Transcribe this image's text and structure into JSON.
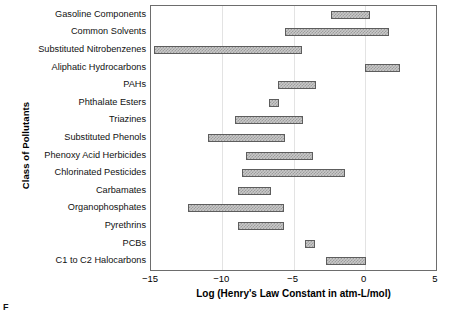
{
  "chart_data": {
    "type": "bar",
    "orientation": "horizontal",
    "subtype": "range-bar",
    "title": "",
    "xlabel": "Log (Henry's Law Constant in atm-L/mol)",
    "ylabel": "Class of Pollutants",
    "xlim": [
      -15,
      5
    ],
    "xticks": [
      -15,
      -10,
      -5,
      0,
      5
    ],
    "xticklabels": [
      "−15",
      "−10",
      "−5",
      "0",
      "5"
    ],
    "grid": "vertical-light",
    "legend": "none",
    "categories": [
      "Gasoline Components",
      "Common Solvents",
      "Substituted Nitrobenzenes",
      "Aliphatic Hydrocarbons",
      "PAHs",
      "Phthalate Esters",
      "Triazines",
      "Substituted Phenols",
      "Phenoxy Acid Herbicides",
      "Chlorinated Pesticides",
      "Carbamates",
      "Organophosphates",
      "Pyrethrins",
      "PCBs",
      "C1 to C2 Halocarbons"
    ],
    "ranges": [
      {
        "category": "Gasoline Components",
        "low": -2.4,
        "high": 0.4
      },
      {
        "category": "Common Solvents",
        "low": -5.6,
        "high": 1.7
      },
      {
        "category": "Substituted Nitrobenzenes",
        "low": -14.8,
        "high": -4.4
      },
      {
        "category": "Aliphatic Hydrocarbons",
        "low": 0.0,
        "high": 2.5
      },
      {
        "category": "PAHs",
        "low": -6.1,
        "high": -3.4
      },
      {
        "category": "Phthalate Esters",
        "low": -6.7,
        "high": -6.0
      },
      {
        "category": "Triazines",
        "low": -9.1,
        "high": -4.3
      },
      {
        "category": "Substituted Phenols",
        "low": -11.0,
        "high": -5.6
      },
      {
        "category": "Phenoxy Acid Herbicides",
        "low": -8.3,
        "high": -3.6
      },
      {
        "category": "Chlorinated Pesticides",
        "low": -8.6,
        "high": -1.4
      },
      {
        "category": "Carbamates",
        "low": -8.9,
        "high": -6.6
      },
      {
        "category": "Organophosphates",
        "low": -12.4,
        "high": -5.7
      },
      {
        "category": "Pyrethrins",
        "low": -8.9,
        "high": -5.7
      },
      {
        "category": "PCBs",
        "low": -4.2,
        "high": -3.5
      },
      {
        "category": "C1 to C2 Halocarbons",
        "low": -2.7,
        "high": 0.1
      }
    ],
    "colors": {
      "bar_fill": "#c9c9c9",
      "bar_hatch": "#9d9d9d",
      "bar_edge": "#5d5d5d",
      "axis": "#6d6d6d",
      "grid": "#e3e3e3",
      "text": "#111111"
    }
  },
  "caption": {
    "sliver": "F"
  }
}
